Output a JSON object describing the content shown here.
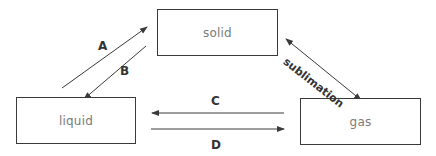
{
  "diagram": {
    "type": "state-transition",
    "states": {
      "solid": {
        "label": "solid"
      },
      "liquid": {
        "label": "liquid"
      },
      "gas": {
        "label": "gas"
      }
    },
    "transitions": [
      {
        "id": "A",
        "label": "A",
        "from": "liquid",
        "to": "solid"
      },
      {
        "id": "B",
        "label": "B",
        "from": "solid",
        "to": "liquid"
      },
      {
        "id": "C",
        "label": "C",
        "from": "gas",
        "to": "liquid"
      },
      {
        "id": "D",
        "label": "D",
        "from": "liquid",
        "to": "gas"
      },
      {
        "id": "sublimation",
        "label": "sublimation",
        "from": "solid",
        "to": "gas",
        "bidirectional": true
      }
    ],
    "colors": {
      "line": "#3a3a3a",
      "box_text": "#7a7a7a",
      "label_text": "#333333",
      "background": "#ffffff"
    }
  }
}
